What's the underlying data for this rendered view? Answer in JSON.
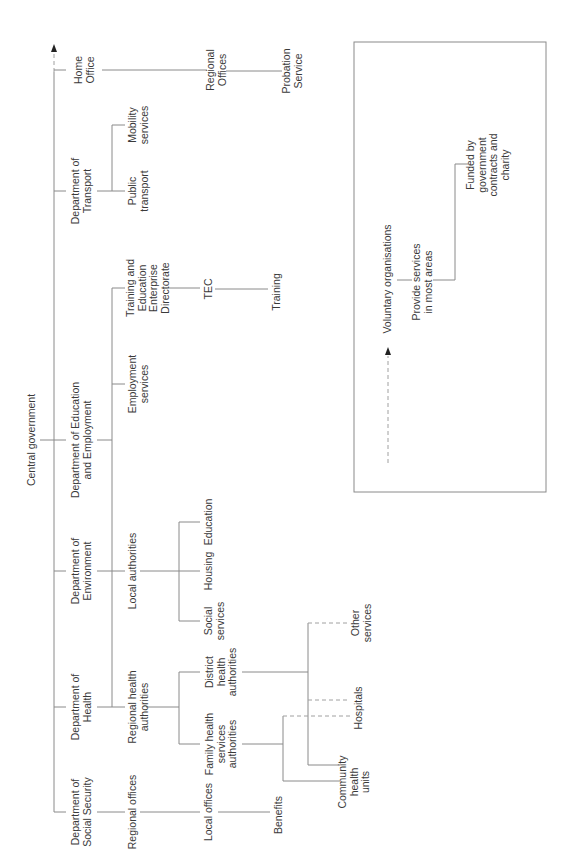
{
  "root": {
    "label": "Central government"
  },
  "departments": [
    {
      "id": "dss",
      "label": "Department of\nSocial Security"
    },
    {
      "id": "doh",
      "label": "Department of\nHealth"
    },
    {
      "id": "doe",
      "label": "Department of\nEnvironment"
    },
    {
      "id": "dee",
      "label": "Department of Education\nand Employment"
    },
    {
      "id": "dot",
      "label": "Department of\nTransport"
    },
    {
      "id": "ho",
      "label": "Home\nOffice"
    }
  ],
  "level2": {
    "regional_offices": "Regional offices",
    "regional_health_authorities": "Regional health\nauthorities",
    "local_authorities": "Local authorities",
    "employment_services": "Employment\nservices",
    "teed": "Training and\nEducation\nEnterprise\nDirectorate",
    "public_transport": "Public\ntransport",
    "mobility_services": "Mobility\nservices",
    "ho_regional_offices": "Regional\nOffices"
  },
  "level3": {
    "local_offices": "Local offices",
    "fhsa": "Family health\nservices\nauthorities",
    "dha": "District\nhealth\nauthorities",
    "social_services": "Social\nservices",
    "housing": "Housing",
    "education": "Education",
    "tec": "TEC",
    "probation_service": "Probation\nService"
  },
  "level4": {
    "benefits": "Benefits",
    "training": "Training",
    "community_health_units": "Community\nhealth\nunits",
    "hospitals": "Hospitals",
    "other_services": "Other\nservices"
  },
  "voluntary": {
    "title": "Voluntary organisations",
    "provide": "Provide services\nin most areas",
    "funded": "Funded by\ngovernment\ncontracts and\ncharity"
  },
  "colors": {
    "line": "#8a8a8a",
    "text": "#3a3a3a",
    "arrow": "#222222"
  }
}
